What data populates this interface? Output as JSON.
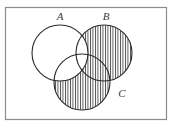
{
  "figure": {
    "type": "venn-diagram",
    "title": "",
    "background_color": "#ffffff",
    "line_color": "#2b2b2b",
    "hatch_color": "#4a4a4a",
    "frame_color": "#8c8c8c"
  },
  "universe": {
    "name": "universal-set-rectangle",
    "x": 5.5,
    "y": 7.5,
    "width": 161,
    "height": 112,
    "stroke": "#8c8c8c",
    "stroke_width": 1.2,
    "label": ""
  },
  "circles": [
    {
      "id": "A",
      "label": "A",
      "cx": 60,
      "cy": 53,
      "r": 28,
      "shaded": false,
      "label_x": 60,
      "label_y": 20
    },
    {
      "id": "B",
      "label": "B",
      "cx": 104,
      "cy": 53,
      "r": 28,
      "shaded": true,
      "label_x": 106,
      "label_y": 20
    },
    {
      "id": "C",
      "label": "C",
      "cx": 82,
      "cy": 82,
      "r": 28,
      "shaded": true,
      "label_x": 122,
      "label_y": 97
    }
  ],
  "hatching": {
    "pattern": "vertical-lines",
    "spacing_px": 2.5,
    "stroke_width": 0.9,
    "color": "#4a4a4a",
    "angle_deg": 90
  },
  "shaded_regions": {
    "description": "(B union C) minus A",
    "included": [
      "B only",
      "C only",
      "B intersect C minus A"
    ],
    "excluded": [
      "A only",
      "A intersect B",
      "A intersect C",
      "A intersect B intersect C"
    ]
  },
  "labels": {
    "a": "A",
    "b": "B",
    "c": "C"
  }
}
